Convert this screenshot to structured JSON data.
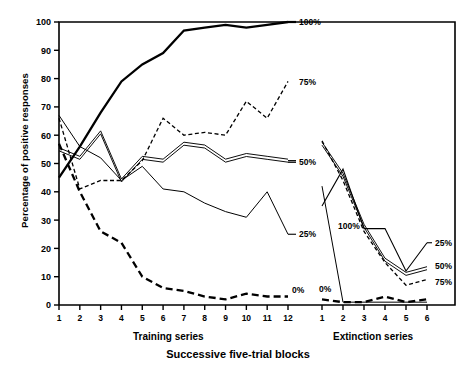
{
  "figure": {
    "ylabel": "Percentage of positive responses",
    "xlabel": "Successive five-trial blocks",
    "panels": [
      {
        "key": "training",
        "title": "Training series"
      },
      {
        "key": "extinction",
        "title": "Extinction series"
      }
    ]
  },
  "axes": {
    "y_ticks": [
      "0",
      "10",
      "20",
      "30",
      "40",
      "50",
      "60",
      "70",
      "80",
      "90",
      "100"
    ],
    "y_values": [
      0,
      10,
      20,
      30,
      40,
      50,
      60,
      70,
      80,
      90,
      100
    ],
    "y_min": 0,
    "y_max": 100,
    "training_x_ticks": [
      "1",
      "2",
      "3",
      "4",
      "5",
      "6",
      "7",
      "8",
      "9",
      "10",
      "11",
      "12"
    ],
    "extinction_x_ticks": [
      "1",
      "2",
      "3",
      "4",
      "5",
      "6"
    ]
  },
  "series_labels": {
    "training": [
      {
        "text": "100%",
        "y": 100
      },
      {
        "text": "75%",
        "y": 79
      },
      {
        "text": "50%",
        "y": 51
      },
      {
        "text": "25%",
        "y": 25
      },
      {
        "text": "0%",
        "y": 3
      }
    ],
    "extinction": [
      {
        "text": "25%",
        "y": 22
      },
      {
        "text": "50%",
        "y": 14
      },
      {
        "text": "75%",
        "y": 9
      },
      {
        "text": "100%",
        "y": 27
      },
      {
        "text": "0%",
        "y": 5
      }
    ]
  },
  "chart_data": {
    "type": "line",
    "title": "",
    "xlabel": "Successive five-trial blocks",
    "ylabel": "Percentage of positive responses",
    "ylim": [
      0,
      100
    ],
    "grid": false,
    "legend": "inline-end-labels",
    "panels": [
      {
        "name": "Training series",
        "x": [
          1,
          2,
          3,
          4,
          5,
          6,
          7,
          8,
          9,
          10,
          11,
          12
        ],
        "series": [
          {
            "name": "100%",
            "style": "thick-solid",
            "values": [
              45,
              56,
              68,
              79,
              85,
              89,
              97,
              98,
              99,
              98,
              99,
              100
            ]
          },
          {
            "name": "75%",
            "style": "dashed",
            "values": [
              66,
              41,
              44,
              44,
              51,
              66,
              60,
              61,
              60,
              72,
              66,
              79
            ]
          },
          {
            "name": "50%",
            "style": "double-solid",
            "values": [
              55,
              52,
              61,
              44,
              52,
              51,
              57,
              56,
              51,
              53,
              52,
              51
            ]
          },
          {
            "name": "25%",
            "style": "thin-solid",
            "values": [
              67,
              56,
              52,
              44,
              49,
              41,
              40,
              36,
              33,
              31,
              40,
              25
            ]
          },
          {
            "name": "0%",
            "style": "heavy-dashed",
            "values": [
              57,
              40,
              26,
              22,
              10,
              6,
              5,
              3,
              2,
              4,
              3,
              3
            ]
          }
        ]
      },
      {
        "name": "Extinction series",
        "x": [
          1,
          2,
          3,
          4,
          5,
          6
        ],
        "series": [
          {
            "name": "100%",
            "style": "thin-solid",
            "values": [
              42,
              1,
              1,
              1,
              1,
              1
            ]
          },
          {
            "name": "75%",
            "style": "dashed",
            "values": [
              58,
              44,
              26,
              15,
              7,
              9
            ]
          },
          {
            "name": "50%",
            "style": "double-solid",
            "values": [
              57,
              46,
              28,
              16,
              11,
              13
            ]
          },
          {
            "name": "25%",
            "style": "thin-solid-2",
            "values": [
              35,
              48,
              27,
              27,
              12,
              22
            ]
          },
          {
            "name": "0%",
            "style": "heavy-dashed",
            "values": [
              2,
              1,
              1,
              3,
              1,
              2
            ]
          }
        ]
      }
    ]
  }
}
